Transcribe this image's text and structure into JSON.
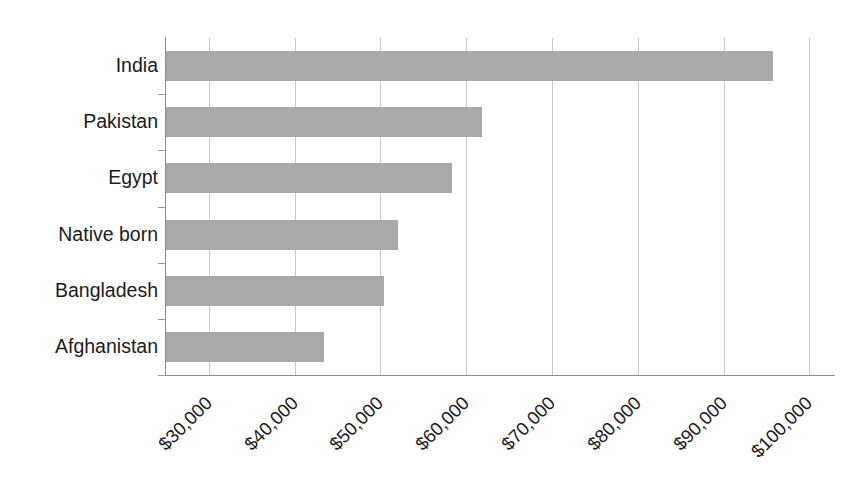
{
  "chart_data": {
    "type": "bar",
    "orientation": "horizontal",
    "title": "",
    "xlabel": "",
    "ylabel": "",
    "categories": [
      "India",
      "Pakistan",
      "Egypt",
      "Native born",
      "Bangladesh",
      "Afghanistan"
    ],
    "values": [
      95800,
      61800,
      58300,
      52000,
      50400,
      43400
    ],
    "value_format": "currency-usd",
    "xlim": [
      25000,
      103000
    ],
    "xticks": [
      30000,
      40000,
      50000,
      60000,
      70000,
      80000,
      90000,
      100000
    ],
    "xtick_labels": [
      "$30,000",
      "$40,000",
      "$50,000",
      "$60,000",
      "$70,000",
      "$80,000",
      "$90,000",
      "$100,000"
    ],
    "xtick_label_rotation": 45,
    "grid": true,
    "grid_axis": "x",
    "legend": false,
    "bar_color": "#a9a9a9",
    "grid_color": "#c9c9c9",
    "axis_color": "#8d8d8d",
    "background_color": "#ffffff"
  },
  "axis": {
    "categories": [
      {
        "label": "India",
        "value": 95800
      },
      {
        "label": "Pakistan",
        "value": 61800
      },
      {
        "label": "Egypt",
        "value": 58300
      },
      {
        "label": "Native born",
        "value": 52000
      },
      {
        "label": "Bangladesh",
        "value": 50400
      },
      {
        "label": "Afghanistan",
        "value": 43400
      }
    ],
    "xticks": [
      {
        "label": "$30,000",
        "value": 30000
      },
      {
        "label": "$40,000",
        "value": 40000
      },
      {
        "label": "$50,000",
        "value": 50000
      },
      {
        "label": "$60,000",
        "value": 60000
      },
      {
        "label": "$70,000",
        "value": 70000
      },
      {
        "label": "$80,000",
        "value": 80000
      },
      {
        "label": "$90,000",
        "value": 90000
      },
      {
        "label": "$100,000",
        "value": 100000
      }
    ]
  }
}
